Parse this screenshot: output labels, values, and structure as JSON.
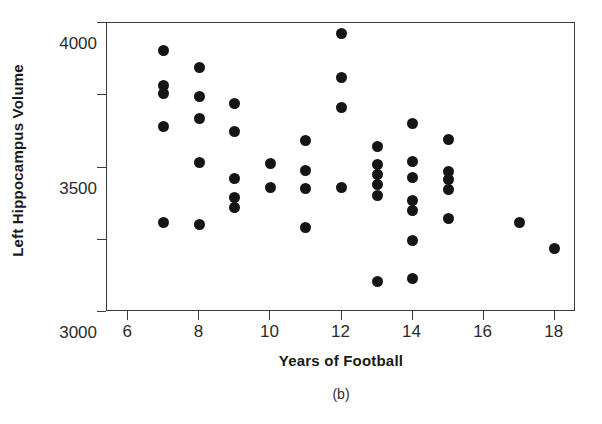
{
  "chart_data": {
    "type": "scatter",
    "title": "",
    "caption": "(b)",
    "xlabel": "Years of Football",
    "ylabel": "Left Hippocampus Volume",
    "xlim": [
      5.4,
      18.6
    ],
    "ylim": [
      2000,
      4000
    ],
    "xticks": [
      6,
      8,
      10,
      12,
      14,
      16,
      18
    ],
    "yticks": [
      2000,
      2500,
      3000,
      3500,
      4000
    ],
    "grid": false,
    "legend": null,
    "marker": {
      "shape": "circle",
      "color": "#151515",
      "size": 11
    },
    "points": [
      {
        "x": 7,
        "y": 3810
      },
      {
        "x": 7,
        "y": 3570
      },
      {
        "x": 7,
        "y": 3510
      },
      {
        "x": 7,
        "y": 3285
      },
      {
        "x": 7,
        "y": 2620
      },
      {
        "x": 8,
        "y": 3695
      },
      {
        "x": 8,
        "y": 3490
      },
      {
        "x": 8,
        "y": 3340
      },
      {
        "x": 8,
        "y": 3035
      },
      {
        "x": 8,
        "y": 2605
      },
      {
        "x": 9,
        "y": 3440
      },
      {
        "x": 9,
        "y": 3250
      },
      {
        "x": 9,
        "y": 2925
      },
      {
        "x": 9,
        "y": 2790
      },
      {
        "x": 9,
        "y": 2720
      },
      {
        "x": 10,
        "y": 3025
      },
      {
        "x": 10,
        "y": 2860
      },
      {
        "x": 11,
        "y": 3190
      },
      {
        "x": 11,
        "y": 2980
      },
      {
        "x": 11,
        "y": 2855
      },
      {
        "x": 11,
        "y": 2585
      },
      {
        "x": 12,
        "y": 3930
      },
      {
        "x": 12,
        "y": 3625
      },
      {
        "x": 12,
        "y": 3415
      },
      {
        "x": 12,
        "y": 2860
      },
      {
        "x": 13,
        "y": 3145
      },
      {
        "x": 13,
        "y": 3020
      },
      {
        "x": 13,
        "y": 2955
      },
      {
        "x": 13,
        "y": 2880
      },
      {
        "x": 13,
        "y": 2805
      },
      {
        "x": 13,
        "y": 2210
      },
      {
        "x": 14,
        "y": 3305
      },
      {
        "x": 14,
        "y": 3040
      },
      {
        "x": 14,
        "y": 2930
      },
      {
        "x": 14,
        "y": 2775
      },
      {
        "x": 14,
        "y": 2700
      },
      {
        "x": 14,
        "y": 2495
      },
      {
        "x": 14,
        "y": 2230
      },
      {
        "x": 15,
        "y": 3195
      },
      {
        "x": 15,
        "y": 2975
      },
      {
        "x": 15,
        "y": 2920
      },
      {
        "x": 15,
        "y": 2845
      },
      {
        "x": 15,
        "y": 2650
      },
      {
        "x": 17,
        "y": 2620
      },
      {
        "x": 18,
        "y": 2440
      }
    ]
  }
}
